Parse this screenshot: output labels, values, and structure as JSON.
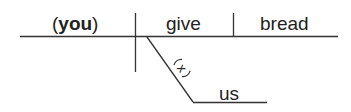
{
  "diagram": {
    "type": "sentence-diagram",
    "subject": {
      "open": "(",
      "word": "you",
      "close": ")"
    },
    "verb": "give",
    "direct_object": "bread",
    "indirect_object": "us",
    "understood_preposition_marker": "x",
    "line_color": "#333333",
    "text_color": "#222222"
  }
}
